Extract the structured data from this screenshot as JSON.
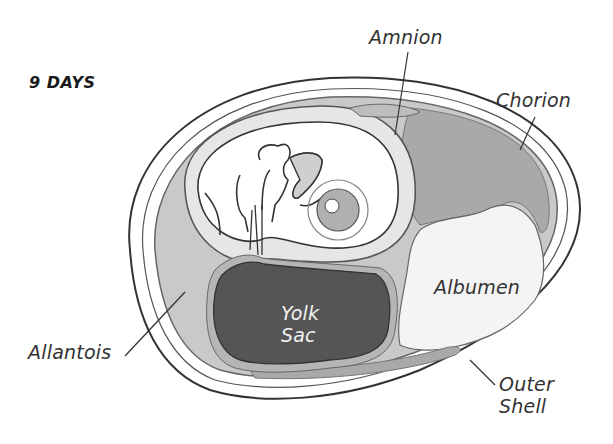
{
  "diagram": {
    "title": "9 DAYS",
    "labels": {
      "amnion": "Amnion",
      "chorion": "Chorion",
      "albumen": "Albumen",
      "yolk_sac_line1": "Yolk",
      "yolk_sac_line2": "Sac",
      "allantois": "Allantois",
      "outer_shell_line1": "Outer",
      "outer_shell_line2": "Shell"
    },
    "colors": {
      "shell_outline": "#333333",
      "allantois_fill": "#c9c9c9",
      "chorion_fill": "#a9a9a9",
      "amnion_fill": "#e6e6e6",
      "embryo_fill": "#ffffff",
      "yolk_fill": "#555555",
      "albumen_fill": "#f4f4f4",
      "eye_fill": "#b0b0b0"
    }
  }
}
